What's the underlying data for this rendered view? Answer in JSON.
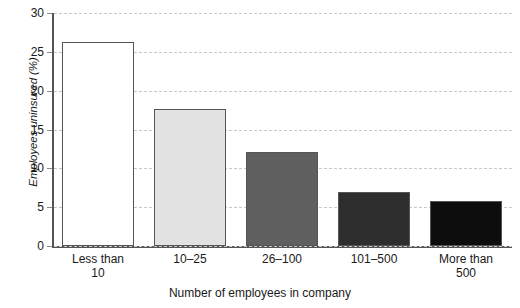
{
  "chart_data": {
    "type": "bar",
    "title": "",
    "xlabel": "Number of employees in company",
    "ylabel": "Employees uninsured (%)",
    "categories": [
      "Less than 10",
      "10–25",
      "26–100",
      "101–500",
      "More than 500"
    ],
    "category_lines": [
      [
        "Less than",
        "10"
      ],
      [
        "10–25",
        ""
      ],
      [
        "26–100",
        ""
      ],
      [
        "101–500",
        ""
      ],
      [
        "More than",
        "500"
      ]
    ],
    "values": [
      26.3,
      17.7,
      12.1,
      7.0,
      5.8
    ],
    "bar_colors": [
      "#ffffff",
      "#e2e2e2",
      "#5f5f5f",
      "#2e2e2e",
      "#0d0d0d"
    ],
    "bar_edge_color": "#555555",
    "ylim": [
      0,
      30
    ],
    "yticks": [
      0,
      5,
      10,
      15,
      20,
      25,
      30
    ],
    "ytick_labels": [
      "0",
      "5",
      "10",
      "15",
      "20",
      "25",
      "30"
    ],
    "grid": true,
    "grid_axis": "y",
    "grid_style": "dashed",
    "legend": "none"
  }
}
